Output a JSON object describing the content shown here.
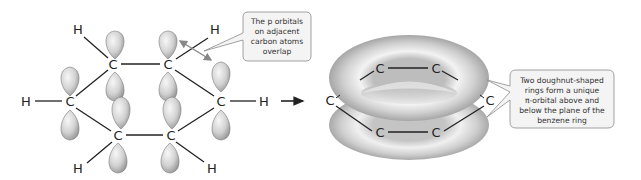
{
  "left_molecule": {
    "carbons": [
      {
        "label": "C",
        "x": 113,
        "y": 68
      },
      {
        "label": "C",
        "x": 168,
        "y": 68
      },
      {
        "label": "C",
        "x": 70,
        "y": 105
      },
      {
        "label": "C",
        "x": 221,
        "y": 105
      },
      {
        "label": "C",
        "x": 118,
        "y": 139
      },
      {
        "label": "C",
        "x": 171,
        "y": 139
      }
    ],
    "hydrogens": [
      {
        "label": "H",
        "x": 78,
        "y": 33
      },
      {
        "label": "H",
        "x": 215,
        "y": 33
      },
      {
        "label": "H",
        "x": 25,
        "y": 105
      },
      {
        "label": "H",
        "x": 264,
        "y": 105
      },
      {
        "label": "H",
        "x": 78,
        "y": 172
      },
      {
        "label": "H",
        "x": 212,
        "y": 172
      }
    ]
  },
  "callout_left": {
    "lines": [
      "The p orbitals",
      "on adjacent",
      "carbon atoms",
      "overlap"
    ]
  },
  "right_molecule": {
    "carbons": [
      {
        "label": "C",
        "x": 380,
        "y": 72
      },
      {
        "label": "C",
        "x": 436,
        "y": 72
      },
      {
        "label": "C",
        "x": 330,
        "y": 104
      },
      {
        "label": "C",
        "x": 490,
        "y": 104
      },
      {
        "label": "C",
        "x": 380,
        "y": 136
      },
      {
        "label": "C",
        "x": 436,
        "y": 136
      }
    ]
  },
  "callout_right": {
    "lines": [
      "Two doughnut-shaped",
      "rings form a unique",
      "π-orbital above and",
      "below the plane of the",
      "benzene ring"
    ]
  },
  "colors": {
    "orbital_light": "#f2f2f2",
    "orbital_dark": "#9a9a9a",
    "callout_border": "#8a8a8a",
    "callout_fill": "#f4f4f4",
    "overlap_arrow": "#888888"
  }
}
